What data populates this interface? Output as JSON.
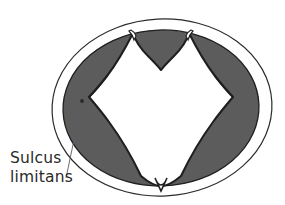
{
  "figure": {
    "name": "neural-tube-cross-section",
    "background_color": "#ffffff",
    "outline_color": "#2b2b2b",
    "mantle_color": "#5c5c5c",
    "lumen_color": "#ffffff",
    "leader_color": "#5a5a6a",
    "text_color": "#2a2a2a"
  },
  "annotations": {
    "sulcus_limitans": {
      "line1": "Sulcus",
      "line2": "limitans",
      "full_label": "Sulcus limitans",
      "text_x": 10,
      "text_y_line1": 163,
      "text_y_line2": 182,
      "pointer_dot_x": 82,
      "pointer_dot_y": 101,
      "leader_start_x": 82,
      "leader_start_y": 102,
      "leader_end_x": 66,
      "leader_end_y": 178
    }
  },
  "geometry": {
    "outer_ellipse": {
      "cx": 162,
      "cy": 107.5,
      "rx": 110,
      "ry": 88.5,
      "rotation_deg": -3,
      "stroke_width": 1.2
    },
    "mantle_outer_ellipse": {
      "cx": 161,
      "cy": 108,
      "rx": 98,
      "ry": 78
    },
    "notch_top_left_x": 133,
    "notch_top_right_x": 164,
    "ventral_v_apex_x": 161,
    "ventral_v_apex_y": 186
  }
}
